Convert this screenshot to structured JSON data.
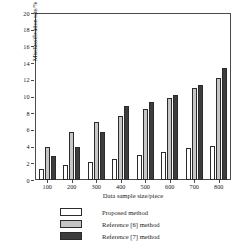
{
  "chart_data": {
    "type": "bar",
    "title": "",
    "subtitle": "",
    "xlabel": "Data sample size/piece",
    "ylabel": "Misclassification rate/%",
    "categories": [
      "100",
      "200",
      "300",
      "400",
      "500",
      "600",
      "700",
      "800"
    ],
    "series": [
      {
        "name": "Proposed method",
        "color": "#ffffff",
        "values": [
          1.3,
          1.8,
          2.2,
          2.5,
          3.0,
          3.4,
          3.8,
          4.1
        ]
      },
      {
        "name": "Reference [6] method",
        "color": "#c6c6c6",
        "values": [
          3.9,
          5.7,
          6.9,
          7.7,
          8.5,
          9.8,
          11.0,
          12.2
        ]
      },
      {
        "name": "Reference [7] method",
        "color": "#3d3d3d",
        "values": [
          2.9,
          4.0,
          5.8,
          8.9,
          9.4,
          10.2,
          11.4,
          13.4
        ]
      }
    ],
    "ylim": [
      0,
      20
    ],
    "yticks": [
      0,
      2,
      4,
      6,
      8,
      10,
      12,
      14,
      16,
      18,
      20
    ],
    "ytick_labels": [
      "0",
      "2",
      "4",
      "6",
      "8",
      "10",
      "12",
      "14",
      "16",
      "18",
      "20"
    ],
    "grid": false,
    "legend_position": "bottom",
    "legend": [
      "Proposed method",
      "Reference [6] method",
      "Reference [7] method"
    ]
  }
}
